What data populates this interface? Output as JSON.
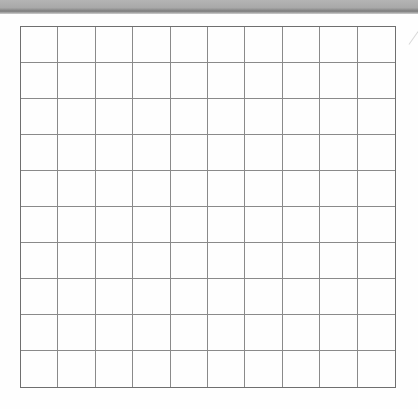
{
  "document": {
    "type": "blank grid worksheet",
    "grid": {
      "rows": 10,
      "columns": 10,
      "line_color": "#8a8a8a",
      "border_color": "#6f6f6f"
    },
    "top_band_color": "#a9a9a9",
    "background_color": "#fefefe"
  }
}
